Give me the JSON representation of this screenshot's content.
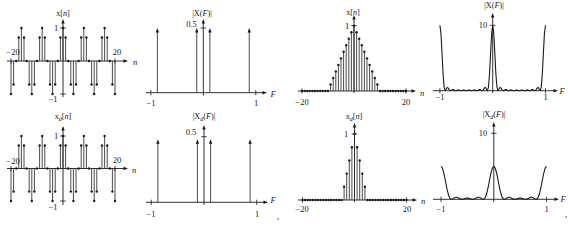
{
  "figure": {
    "separators": [
      ",",
      ","
    ]
  },
  "chart_data": [
    {
      "id": "x_n_periodic",
      "panel": "row1-col1",
      "type": "stem",
      "title": "x[n]",
      "title_parts": {
        "base": "x",
        "open": "[",
        "var": "n",
        "close": "]"
      },
      "xlabel": "n",
      "xlim": [
        -20,
        20
      ],
      "ylim": [
        -1,
        1
      ],
      "yticks": [
        1,
        -1
      ],
      "xtick_labels": [
        "−20",
        "20"
      ],
      "ytick_labels": [
        "1",
        "−1"
      ],
      "n_range": [
        -20,
        20
      ],
      "values": [
        -1,
        -0.71,
        0,
        0.71,
        1,
        0.71,
        0,
        -0.71,
        -1,
        -0.71,
        0,
        0.71,
        1,
        0.71,
        0,
        -0.71,
        -1,
        -0.71,
        0,
        0.71,
        1,
        0.71,
        0,
        -0.71,
        -1,
        -0.71,
        0,
        0.71,
        1,
        0.71,
        0,
        -0.71,
        -1,
        -0.71,
        0,
        0.71,
        1,
        0.71,
        0,
        -0.71,
        -1
      ]
    },
    {
      "id": "X_F_line_spectrum",
      "panel": "row1-col2",
      "type": "line_spectrum",
      "title": "|X(F)|",
      "title_parts": {
        "base": "|X",
        "open": "(",
        "var": "F",
        "close": ")|"
      },
      "xlabel": "F",
      "xlim": [
        -1,
        1
      ],
      "yticks": [
        0.5
      ],
      "xtick_labels": [
        "−1",
        "1"
      ],
      "ytick_labels": [
        "0.5"
      ],
      "F": [
        -0.875,
        -0.125,
        0.125,
        0.875
      ],
      "values": [
        0.5,
        0.5,
        0.5,
        0.5
      ]
    },
    {
      "id": "x_n_triangle",
      "panel": "row1-col3",
      "type": "stem",
      "title": "x[n]",
      "title_parts": {
        "base": "x",
        "open": "[",
        "var": "n",
        "close": "]"
      },
      "xlabel": "n",
      "xlim": [
        -20,
        20
      ],
      "ylim": [
        0,
        1
      ],
      "yticks": [
        1
      ],
      "xtick_labels": [
        "−20",
        "20"
      ],
      "ytick_labels": [
        "1"
      ],
      "n_range": [
        -20,
        20
      ],
      "values": [
        0,
        0,
        0,
        0,
        0,
        0,
        0,
        0,
        0,
        0,
        0,
        0.1,
        0.2,
        0.3,
        0.4,
        0.5,
        0.6,
        0.7,
        0.8,
        0.9,
        1,
        0.9,
        0.8,
        0.7,
        0.6,
        0.5,
        0.4,
        0.3,
        0.2,
        0.1,
        0,
        0,
        0,
        0,
        0,
        0,
        0,
        0,
        0,
        0,
        0
      ]
    },
    {
      "id": "X_F_magnitude",
      "panel": "row1-col4",
      "type": "line",
      "title": "|X(F)|",
      "title_parts": {
        "base": "|X",
        "open": "(",
        "var": "F",
        "close": ")|"
      },
      "xlabel": "F",
      "xlim": [
        -1,
        1
      ],
      "ylim": [
        0,
        10
      ],
      "yticks": [
        10
      ],
      "xtick_labels": [
        "−1",
        "1"
      ],
      "ytick_labels": [
        "10"
      ],
      "F_range": [
        -1,
        1
      ],
      "F_step": 0.02,
      "values": [
        10,
        8.76,
        5.76,
        2.58,
        0.56,
        0,
        0.26,
        0.5,
        0.39,
        0.12,
        0,
        0.09,
        0.19,
        0.17,
        0.06,
        0,
        0.05,
        0.12,
        0.11,
        0.04,
        0,
        0.04,
        0.09,
        0.09,
        0.04,
        0,
        0.04,
        0.09,
        0.09,
        0.04,
        0,
        0.04,
        0.11,
        0.12,
        0.05,
        0,
        0.06,
        0.17,
        0.19,
        0.09,
        0,
        0.12,
        0.39,
        0.5,
        0.26,
        0,
        0.56,
        2.58,
        5.76,
        8.76,
        10,
        8.76,
        5.76,
        2.58,
        0.56,
        0,
        0.26,
        0.5,
        0.39,
        0.12,
        0,
        0.09,
        0.19,
        0.17,
        0.06,
        0,
        0.05,
        0.12,
        0.11,
        0.04,
        0,
        0.04,
        0.09,
        0.09,
        0.04,
        0,
        0.04,
        0.09,
        0.09,
        0.04,
        0,
        0.04,
        0.11,
        0.12,
        0.05,
        0,
        0.06,
        0.17,
        0.19,
        0.09,
        0,
        0.12,
        0.39,
        0.5,
        0.26,
        0,
        0.56,
        2.58,
        5.76,
        8.76,
        10
      ]
    },
    {
      "id": "xd_n_periodic",
      "panel": "row2-col1",
      "type": "stem",
      "title": "x_d[n]",
      "title_parts": {
        "base": "x",
        "sub": "d",
        "open": "[",
        "var": "n",
        "close": "]"
      },
      "xlabel": "n",
      "xlim": [
        -20,
        20
      ],
      "ylim": [
        -1,
        1
      ],
      "yticks": [
        1,
        -1
      ],
      "xtick_labels": [
        "−20",
        "20"
      ],
      "ytick_labels": [
        "1",
        "−1"
      ],
      "n_range": [
        -20,
        20
      ],
      "values": [
        -1,
        -0.71,
        0,
        0.71,
        1,
        0.71,
        0,
        -0.71,
        -1,
        -0.71,
        0,
        0.71,
        1,
        0.71,
        0,
        -0.71,
        -1,
        -0.71,
        0,
        0.71,
        1,
        0.71,
        0,
        -0.71,
        -1,
        -0.71,
        0,
        0.71,
        1,
        0.71,
        0,
        -0.71,
        -1,
        -0.71,
        0,
        0.71,
        1,
        0.71,
        0,
        -0.71,
        -1
      ]
    },
    {
      "id": "Xd_F_line_spectrum",
      "panel": "row2-col2",
      "type": "line_spectrum",
      "title": "|X_d(F)|",
      "title_parts": {
        "base": "|X",
        "sub": "d",
        "open": "(",
        "var": "F",
        "close": ")|"
      },
      "xlabel": "F",
      "xlim": [
        -1,
        1
      ],
      "yticks": [
        0.5
      ],
      "xtick_labels": [
        "−1",
        "1"
      ],
      "ytick_labels": [
        "0.5"
      ],
      "F": [
        -0.875,
        -0.125,
        0.125,
        0.875
      ],
      "values": [
        0.48,
        0.48,
        0.48,
        0.48
      ]
    },
    {
      "id": "xd_n_triangle",
      "panel": "row2-col3",
      "type": "stem",
      "title": "x_d[n]",
      "title_parts": {
        "base": "x",
        "sub": "d",
        "open": "[",
        "var": "n",
        "close": "]"
      },
      "xlabel": "n",
      "xlim": [
        -20,
        20
      ],
      "ylim": [
        0,
        1
      ],
      "yticks": [
        1
      ],
      "xtick_labels": [
        "−20",
        "20"
      ],
      "ytick_labels": [
        "1"
      ],
      "n_range": [
        -20,
        20
      ],
      "values": [
        0,
        0,
        0,
        0,
        0,
        0,
        0,
        0,
        0,
        0,
        0,
        0,
        0,
        0,
        0,
        0,
        0.2,
        0.4,
        0.6,
        0.8,
        1,
        0.8,
        0.6,
        0.4,
        0.2,
        0,
        0,
        0,
        0,
        0,
        0,
        0,
        0,
        0,
        0,
        0,
        0,
        0,
        0,
        0,
        0
      ]
    },
    {
      "id": "Xd_F_magnitude",
      "panel": "row2-col4",
      "type": "line",
      "title": "|X_d(F)|",
      "title_parts": {
        "base": "|X",
        "sub": "d",
        "open": "(",
        "var": "F",
        "close": ")|"
      },
      "xlabel": "F",
      "xlim": [
        -1,
        1
      ],
      "ylim": [
        0,
        10
      ],
      "yticks": [
        10
      ],
      "xtick_labels": [
        "−1",
        "1"
      ],
      "ytick_labels": [
        "10"
      ],
      "F_range": [
        -1,
        1
      ],
      "F_step": 0.02,
      "values": [
        5,
        4.84,
        4.4,
        3.73,
        2.93,
        2.09,
        1.34,
        0.72,
        0.3,
        0.07,
        0,
        0.05,
        0.15,
        0.25,
        0.3,
        0.31,
        0.25,
        0.17,
        0.08,
        0.02,
        0,
        0.02,
        0.07,
        0.13,
        0.18,
        0.2,
        0.18,
        0.13,
        0.07,
        0.02,
        0,
        0.02,
        0.08,
        0.17,
        0.25,
        0.31,
        0.3,
        0.25,
        0.15,
        0.05,
        0,
        0.07,
        0.3,
        0.72,
        1.34,
        2.09,
        2.93,
        3.73,
        4.4,
        4.84,
        5,
        4.84,
        4.4,
        3.73,
        2.93,
        2.09,
        1.34,
        0.72,
        0.3,
        0.07,
        0,
        0.05,
        0.15,
        0.25,
        0.3,
        0.31,
        0.25,
        0.17,
        0.08,
        0.02,
        0,
        0.02,
        0.07,
        0.13,
        0.18,
        0.2,
        0.18,
        0.13,
        0.07,
        0.02,
        0,
        0.02,
        0.08,
        0.17,
        0.25,
        0.31,
        0.3,
        0.25,
        0.15,
        0.05,
        0,
        0.07,
        0.3,
        0.72,
        1.34,
        2.09,
        2.93,
        3.73,
        4.4,
        4.84,
        5
      ]
    }
  ]
}
